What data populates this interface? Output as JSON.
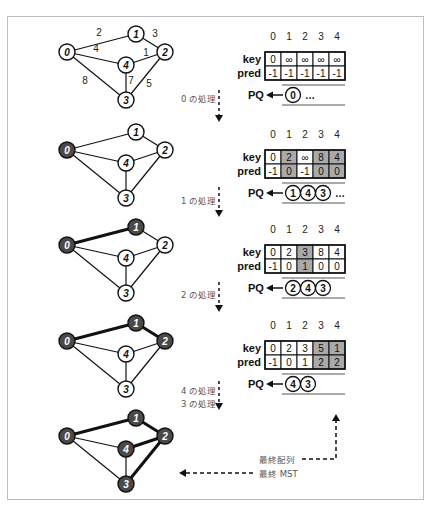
{
  "colors": {
    "visited_node": "#4a4a4a",
    "unvisited_node": "#ffffff",
    "highlight_cell": "#a9a9a9",
    "edge": "#111111",
    "frame": "#bdbdbd"
  },
  "graph": {
    "nodes": [
      "0",
      "1",
      "2",
      "3",
      "4"
    ],
    "edges": [
      {
        "from": "0",
        "to": "1",
        "weight": "2"
      },
      {
        "from": "1",
        "to": "2",
        "weight": "3"
      },
      {
        "from": "0",
        "to": "4",
        "weight": "4"
      },
      {
        "from": "4",
        "to": "2",
        "weight": "1"
      },
      {
        "from": "0",
        "to": "3",
        "weight": "8"
      },
      {
        "from": "4",
        "to": "3",
        "weight": "7"
      },
      {
        "from": "2",
        "to": "3",
        "weight": "5"
      }
    ]
  },
  "table_labels": {
    "indices": [
      "0",
      "1",
      "2",
      "3",
      "4"
    ],
    "key": "key",
    "pred": "pred",
    "pq": "PQ"
  },
  "stages": [
    {
      "visited": [],
      "mst_edges": [],
      "show_weights": true,
      "key": [
        "0",
        "∞",
        "∞",
        "∞",
        "∞"
      ],
      "pred": [
        "-1",
        "-1",
        "-1",
        "-1",
        "-1"
      ],
      "highlight": [],
      "pq": [
        "0"
      ],
      "pq_more": "…",
      "step_label": "0 の処理"
    },
    {
      "visited": [
        "0"
      ],
      "mst_edges": [],
      "show_weights": false,
      "key": [
        "0",
        "2",
        "∞",
        "8",
        "4"
      ],
      "pred": [
        "-1",
        "0",
        "-1",
        "0",
        "0"
      ],
      "highlight": [
        1,
        3,
        4
      ],
      "pq": [
        "1",
        "4",
        "3"
      ],
      "pq_more": "…",
      "step_label": "1 の処理"
    },
    {
      "visited": [
        "0",
        "1"
      ],
      "mst_edges": [
        [
          "0",
          "1"
        ]
      ],
      "show_weights": false,
      "key": [
        "0",
        "2",
        "3",
        "8",
        "4"
      ],
      "pred": [
        "-1",
        "0",
        "1",
        "0",
        "0"
      ],
      "highlight": [
        2
      ],
      "pq": [
        "2",
        "4",
        "3"
      ],
      "pq_more": "",
      "step_label": "2 の処理"
    },
    {
      "visited": [
        "0",
        "1",
        "2"
      ],
      "mst_edges": [
        [
          "0",
          "1"
        ],
        [
          "1",
          "2"
        ]
      ],
      "show_weights": false,
      "key": [
        "0",
        "2",
        "3",
        "5",
        "1"
      ],
      "pred": [
        "-1",
        "0",
        "1",
        "2",
        "2"
      ],
      "highlight": [
        3,
        4
      ],
      "pq": [
        "4",
        "3"
      ],
      "pq_more": "",
      "step_label": "4 の処理",
      "step_label_2": "3 の処理"
    },
    {
      "visited": [
        "0",
        "1",
        "2",
        "3",
        "4"
      ],
      "mst_edges": [
        [
          "0",
          "1"
        ],
        [
          "1",
          "2"
        ],
        [
          "2",
          "4"
        ],
        [
          "2",
          "3"
        ]
      ],
      "show_weights": false
    }
  ],
  "final": {
    "array_label": "最終配列",
    "mst_label": "最終 MST"
  }
}
